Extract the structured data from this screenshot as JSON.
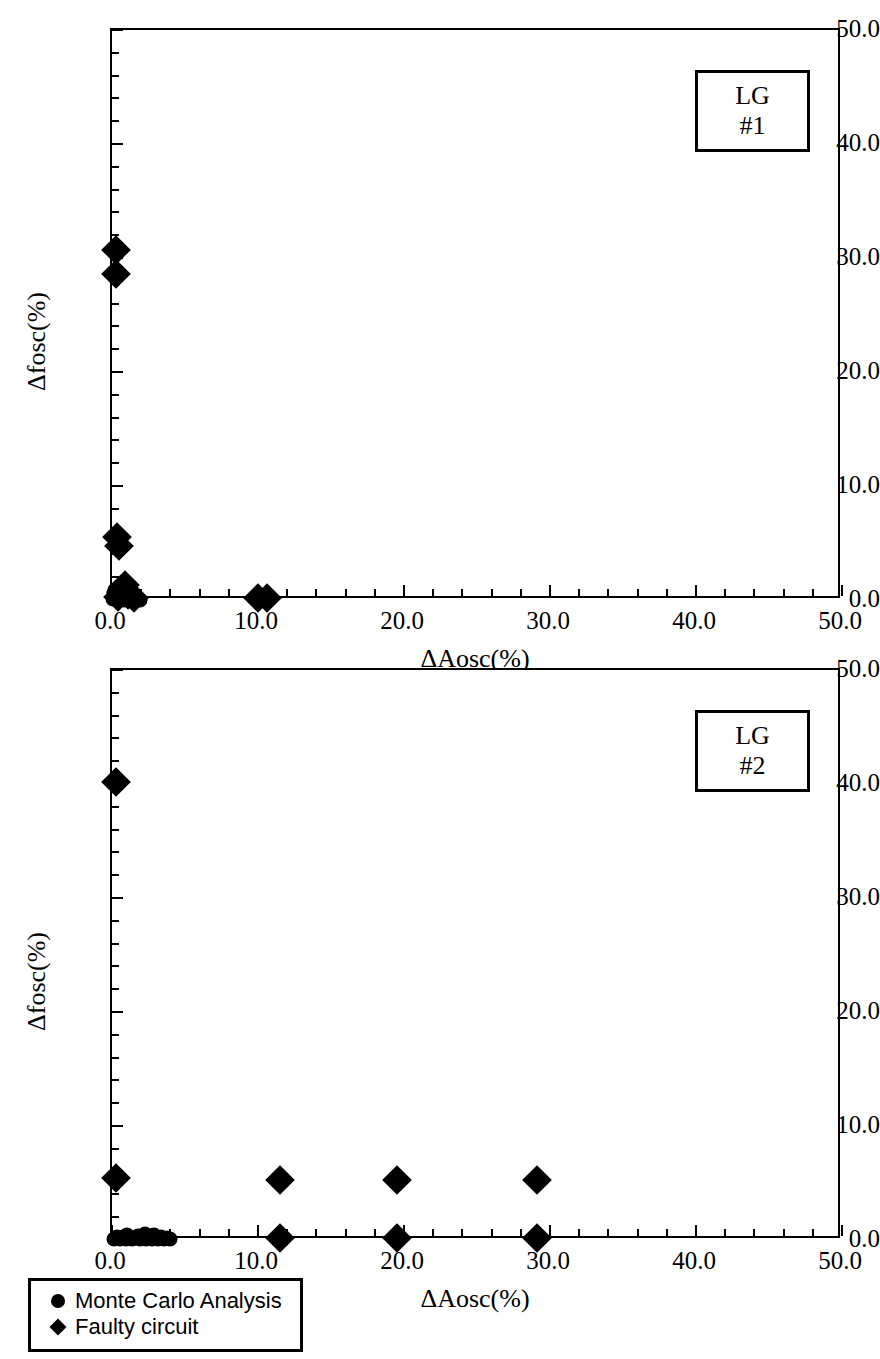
{
  "figure": {
    "panels": [
      {
        "id": "LG #1",
        "id_box_label": "LG #1"
      },
      {
        "id": "LG #2",
        "id_box_label": "LG #2"
      }
    ],
    "legend": {
      "entries": [
        {
          "symbol": "circle",
          "label": "Monte Carlo Analysis"
        },
        {
          "symbol": "diamond",
          "label": "Faulty circuit"
        }
      ]
    }
  },
  "chart_data": [
    {
      "type": "scatter",
      "title": "LG #1",
      "xlabel": "ΔAosc(%)",
      "ylabel": "Δfosc(%)",
      "xlim": [
        0.0,
        50.0
      ],
      "ylim": [
        0.0,
        50.0
      ],
      "xticks": [
        0.0,
        10.0,
        20.0,
        30.0,
        40.0,
        50.0
      ],
      "yticks": [
        0.0,
        10.0,
        20.0,
        30.0,
        40.0,
        50.0
      ],
      "xtick_labels": [
        "0.0",
        "10.0",
        "20.0",
        "30.0",
        "40.0",
        "50.0"
      ],
      "ytick_labels": [
        "0.0",
        "10.0",
        "20.0",
        "30.0",
        "40.0",
        "50.0"
      ],
      "minor_ticks_per_major": 5,
      "grid": false,
      "legend_position": "below-figure",
      "series": [
        {
          "name": "Monte Carlo Analysis",
          "marker": "circle",
          "points": [
            [
              0.1,
              0.05
            ],
            [
              0.25,
              0.1
            ],
            [
              0.35,
              0.0
            ],
            [
              0.45,
              0.15
            ],
            [
              0.55,
              0.05
            ],
            [
              0.7,
              0.2
            ],
            [
              0.8,
              0.0
            ],
            [
              0.95,
              0.1
            ],
            [
              1.05,
              0.05
            ],
            [
              1.2,
              0.15
            ],
            [
              1.35,
              0.0
            ],
            [
              1.5,
              0.1
            ],
            [
              1.65,
              0.05
            ],
            [
              1.8,
              0.12
            ],
            [
              1.95,
              0.0
            ],
            [
              0.15,
              0.6
            ],
            [
              0.3,
              0.35
            ],
            [
              0.6,
              0.45
            ],
            [
              0.2,
              0.9
            ]
          ]
        },
        {
          "name": "Faulty circuit",
          "marker": "diamond",
          "points": [
            [
              0.3,
              30.7
            ],
            [
              0.3,
              28.6
            ],
            [
              0.35,
              5.5
            ],
            [
              0.45,
              4.7
            ],
            [
              10.0,
              0.15
            ],
            [
              10.6,
              0.15
            ],
            [
              0.9,
              1.3
            ],
            [
              0.6,
              0.7
            ],
            [
              1.1,
              0.45
            ],
            [
              0.4,
              0.25
            ],
            [
              1.5,
              0.2
            ]
          ]
        }
      ]
    },
    {
      "type": "scatter",
      "title": "LG #2",
      "xlabel": "ΔAosc(%)",
      "ylabel": "Δfosc(%)",
      "xlim": [
        0.0,
        50.0
      ],
      "ylim": [
        0.0,
        50.0
      ],
      "xticks": [
        0.0,
        10.0,
        20.0,
        30.0,
        40.0,
        50.0
      ],
      "yticks": [
        0.0,
        10.0,
        20.0,
        30.0,
        40.0,
        50.0
      ],
      "xtick_labels": [
        "0.0",
        "10.0",
        "20.0",
        "30.0",
        "40.0",
        "50.0"
      ],
      "ytick_labels": [
        "0.0",
        "10.0",
        "20.0",
        "30.0",
        "40.0",
        "50.0"
      ],
      "minor_ticks_per_major": 5,
      "grid": false,
      "legend_position": "below-figure",
      "series": [
        {
          "name": "Monte Carlo Analysis",
          "marker": "circle",
          "points": [
            [
              0.15,
              0.1
            ],
            [
              0.35,
              0.25
            ],
            [
              0.55,
              0.05
            ],
            [
              0.75,
              0.3
            ],
            [
              0.95,
              0.1
            ],
            [
              1.15,
              0.25
            ],
            [
              1.35,
              0.05
            ],
            [
              1.55,
              0.2
            ],
            [
              1.75,
              0.35
            ],
            [
              1.95,
              0.1
            ],
            [
              2.15,
              0.28
            ],
            [
              2.35,
              0.08
            ],
            [
              2.55,
              0.32
            ],
            [
              2.75,
              0.12
            ],
            [
              2.95,
              0.3
            ],
            [
              3.15,
              0.1
            ],
            [
              3.35,
              0.26
            ],
            [
              3.55,
              0.08
            ],
            [
              3.75,
              0.2
            ],
            [
              3.95,
              0.1
            ],
            [
              1.05,
              0.45
            ],
            [
              2.25,
              0.5
            ],
            [
              2.85,
              0.45
            ]
          ]
        },
        {
          "name": "Faulty circuit",
          "marker": "diamond",
          "points": [
            [
              0.3,
              40.2
            ],
            [
              0.3,
              5.4
            ],
            [
              11.5,
              5.3
            ],
            [
              19.5,
              5.3
            ],
            [
              29.1,
              5.3
            ],
            [
              11.5,
              0.15
            ],
            [
              19.5,
              0.15
            ],
            [
              29.1,
              0.15
            ]
          ]
        }
      ]
    }
  ]
}
